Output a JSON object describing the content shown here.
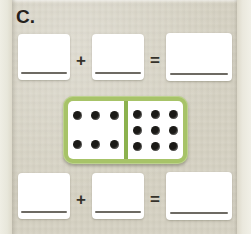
{
  "worksheet": {
    "problem_label": "C.",
    "background_color": "#d5d1c2",
    "accent_color": "#a7c368"
  },
  "top_equation": {
    "operator_plus": "+",
    "operator_equals": "=",
    "boxes": [
      {
        "name": "top-addend-1",
        "value": "",
        "placeholder": ""
      },
      {
        "name": "top-addend-2",
        "value": "",
        "placeholder": ""
      },
      {
        "name": "top-sum",
        "value": "",
        "placeholder": ""
      }
    ]
  },
  "bottom_equation": {
    "operator_plus": "+",
    "operator_equals": "=",
    "boxes": [
      {
        "name": "bottom-addend-1",
        "value": "",
        "placeholder": ""
      },
      {
        "name": "bottom-addend-2",
        "value": "",
        "placeholder": ""
      },
      {
        "name": "bottom-sum",
        "value": "",
        "placeholder": ""
      }
    ]
  },
  "domino": {
    "left_half": {
      "pip_count": 6,
      "rows": [
        3,
        3
      ]
    },
    "right_half": {
      "pip_count": 9,
      "rows": [
        3,
        3,
        3
      ]
    },
    "total_pips": 15,
    "frame_color": "#a7c368",
    "divider_color": "#8cb24e",
    "pip_color": "#1b1a17"
  }
}
